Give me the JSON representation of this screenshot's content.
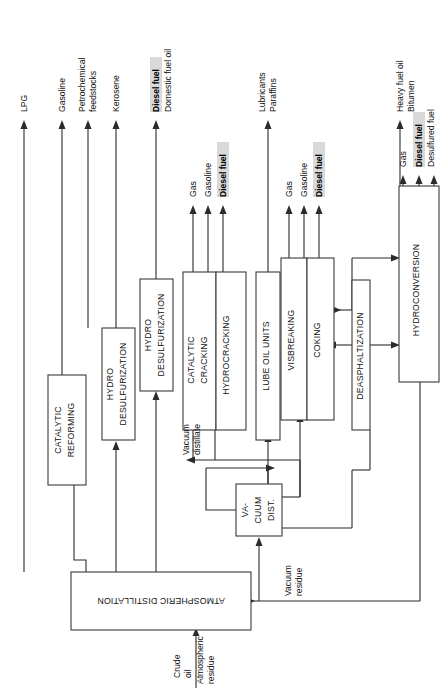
{
  "diagram": {
    "orientation": "rotated-90-ccw",
    "feed": {
      "label_line1": "Crude",
      "label_line2": "oil"
    },
    "units": [
      {
        "id": "atmospheric-distillation",
        "label": "ATMOSPHERIC DISTILLATION",
        "upside_down": true
      },
      {
        "id": "catalytic-reforming",
        "label_line1": "CATALYTIC",
        "label_line2": "REFORMING"
      },
      {
        "id": "hydro-desulfurization-1",
        "label_line1": "HYDRO",
        "label_line2": "DESULFURIZATION"
      },
      {
        "id": "hydro-desulfurization-2",
        "label_line1": "HYDRO",
        "label_line2": "DESULFURIZATION"
      },
      {
        "id": "catalytic-cracking",
        "label_line1": "CATALYTIC",
        "label_line2": "CRACKING"
      },
      {
        "id": "hydrocracking",
        "label": "HYDROCRACKING"
      },
      {
        "id": "lube-oil-units",
        "label": "LUBE OIL UNITS"
      },
      {
        "id": "visbreaking",
        "label": "VISBREAKING"
      },
      {
        "id": "coking",
        "label": "COKING"
      },
      {
        "id": "deasphaltization",
        "label": "DEASPHALTIZATION"
      },
      {
        "id": "vacuum-distillation",
        "label_line1": "VA-",
        "label_line2": "CUUM",
        "label_line3": "DIST."
      },
      {
        "id": "hydroconversion",
        "label": "HYDROCONVERSION"
      }
    ],
    "products": [
      {
        "id": "lpg",
        "label": "LPG",
        "bold": false
      },
      {
        "id": "gasoline",
        "label": "Gasoline",
        "bold": false
      },
      {
        "id": "petrochemical-feedstocks",
        "label_line1": "Petrochemical",
        "label_line2": "feedstocks",
        "bold": false
      },
      {
        "id": "kerosene",
        "label": "Kerosene",
        "bold": false
      },
      {
        "id": "diesel-fuel-1",
        "label": "Diesel fuel",
        "bold": true
      },
      {
        "id": "domestic-fuel-oil",
        "label": "Domestic fuel oil",
        "bold": false
      },
      {
        "id": "cracking-gas",
        "label": "Gas",
        "bold": false
      },
      {
        "id": "cracking-gasoline",
        "label": "Gasoline",
        "bold": false
      },
      {
        "id": "cracking-diesel-fuel",
        "label": "Diesel fuel",
        "bold": true
      },
      {
        "id": "lubricants",
        "label": "Lubricants",
        "bold": false
      },
      {
        "id": "paraffins",
        "label": "Paraffins",
        "bold": false
      },
      {
        "id": "visbreaking-gas",
        "label": "Gas",
        "bold": false
      },
      {
        "id": "visbreaking-gasoline",
        "label": "Gasoline",
        "bold": false
      },
      {
        "id": "visbreaking-diesel-fuel",
        "label": "Diesel fuel",
        "bold": true
      },
      {
        "id": "heavy-fuel-oil",
        "label": "Heavy fuel oil",
        "bold": false
      },
      {
        "id": "bitumen",
        "label": "Bitumen",
        "bold": false
      },
      {
        "id": "hydroconversion-gas",
        "label": "Gas",
        "bold": false
      },
      {
        "id": "hydroconversion-diesel-fuel",
        "label": "Diesel fuel",
        "bold": true
      },
      {
        "id": "desulfured-fuel",
        "label": "Desulfured fuel",
        "bold": false
      }
    ],
    "stream_labels": [
      {
        "id": "atmospheric-residue",
        "label_line1": "Atmospheric",
        "label_line2": "residue"
      },
      {
        "id": "vacuum-distillate",
        "label_line1": "Vacuum",
        "label_line2": "distillate"
      },
      {
        "id": "vacuum-residue",
        "label_line1": "Vacuum",
        "label_line2": "residue"
      }
    ],
    "colors": {
      "line": "#2b2b2b",
      "box_stroke": "#3a3a3a",
      "highlight": "#d9d9d9",
      "background": "#ffffff"
    }
  }
}
